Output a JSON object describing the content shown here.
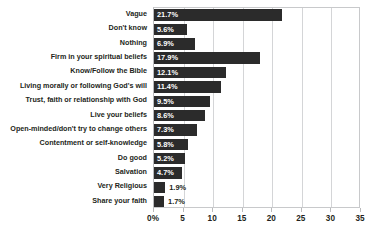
{
  "chart_data": {
    "type": "bar",
    "orientation": "horizontal",
    "title": "",
    "subtitle": "",
    "xlabel": "",
    "ylabel": "",
    "xlim": [
      0,
      35
    ],
    "grid": true,
    "legend": null,
    "xticks": [
      "0%",
      "5",
      "10",
      "15",
      "20",
      "25",
      "30",
      "35"
    ],
    "xtick_values": [
      0,
      5,
      10,
      15,
      20,
      25,
      30,
      35
    ],
    "categories": [
      "Vague",
      "Don't know",
      "Nothing",
      "Firm in your spiritual beliefs",
      "Know/Follow the Bible",
      "Living morally or following God's will",
      "Trust, faith or relationship with God",
      "Live your beliefs",
      "Open-minded/don't try to change others",
      "Contentment or self-knowledge",
      "Do good",
      "Salvation",
      "Very Religious",
      "Share your faith"
    ],
    "values": [
      21.7,
      5.6,
      6.9,
      17.9,
      12.1,
      11.4,
      9.5,
      8.6,
      7.3,
      5.8,
      5.2,
      4.7,
      1.9,
      1.7
    ],
    "value_labels": [
      "21.7%",
      "5.6%",
      "6.9%",
      "17.9%",
      "12.1%",
      "11.4%",
      "9.5%",
      "8.6%",
      "7.3%",
      "5.8%",
      "5.2%",
      "4.7%",
      "1.9%",
      "1.7%"
    ],
    "label_placement": [
      "inside",
      "inside",
      "inside",
      "inside",
      "inside",
      "inside",
      "inside",
      "inside",
      "inside",
      "inside",
      "inside",
      "inside",
      "outside",
      "outside"
    ],
    "colors": {
      "bar": "#2b2b2b",
      "bar_label_inside": "#ffffff",
      "bar_label_outside": "#231f20",
      "gridline": "#d4d5d7",
      "axis": "#b9babc",
      "text": "#231f20",
      "background": "#ffffff"
    }
  }
}
